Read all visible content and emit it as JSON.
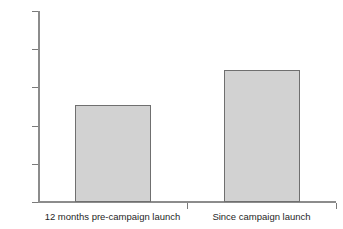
{
  "chart_data": {
    "type": "bar",
    "title": "",
    "subtitle": "",
    "xlabel": "",
    "ylabel": "",
    "categories": [
      "12 months pre-campaign launch",
      "Since campaign launch"
    ],
    "values": [
      3510,
      3690
    ],
    "series": [
      {
        "name": "",
        "values": [
          3510,
          3690
        ]
      }
    ],
    "ylim": [
      3000,
      4000
    ],
    "yticks": [
      3000,
      3200,
      3400,
      3600,
      3800,
      4000
    ],
    "ytick_labels": [
      "3000",
      "3200",
      "3400",
      "3600",
      "3800",
      "4000"
    ],
    "grid": false,
    "legend": false,
    "legend_position": "none",
    "annotations": [],
    "bar_fill_color": "#d2d2d2",
    "bar_edge_color": "#6f6f6f",
    "axis_color": "#8c8c8c",
    "background_color": "#ffffff"
  }
}
